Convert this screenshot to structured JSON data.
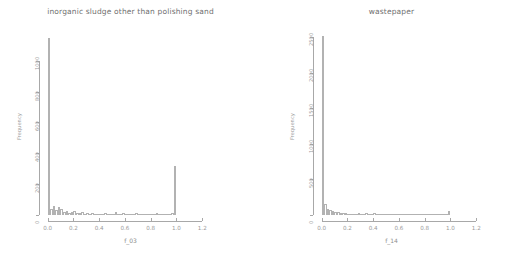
{
  "figure": {
    "background": "#ffffff",
    "line_color": "#a8a8a8",
    "text_color": "#8f8f8f"
  },
  "chart_data": [
    {
      "type": "bar",
      "title": "inorganic sludge other than polishing sand",
      "xlabel": "f_03",
      "ylabel": "Frequency",
      "xlim": [
        -0.02,
        1.26
      ],
      "ylim": [
        0,
        1180
      ],
      "xticks": [
        0.0,
        0.2,
        0.4,
        0.6,
        0.8,
        1.0,
        1.2
      ],
      "xticklabels": [
        "0.0",
        "0.2",
        "0.4",
        "0.6",
        "0.8",
        "1.0",
        "1.2"
      ],
      "yticks": [
        0,
        200,
        400,
        600,
        800,
        1000
      ],
      "yticklabels": [
        "0",
        "200",
        "400",
        "600",
        "800",
        "1000"
      ],
      "grid": false,
      "legend": null,
      "bin_width": 0.02,
      "bin_starts": [
        0.0,
        0.02,
        0.04,
        0.06,
        0.08,
        0.1,
        0.12,
        0.14,
        0.16,
        0.18,
        0.2,
        0.22,
        0.24,
        0.26,
        0.28,
        0.3,
        0.32,
        0.34,
        0.36,
        0.38,
        0.4,
        0.42,
        0.44,
        0.46,
        0.48,
        0.5,
        0.52,
        0.54,
        0.56,
        0.58,
        0.6,
        0.62,
        0.64,
        0.66,
        0.68,
        0.7,
        0.72,
        0.74,
        0.76,
        0.78,
        0.8,
        0.82,
        0.84,
        0.86,
        0.88,
        0.9,
        0.92,
        0.94,
        0.96,
        0.98
      ],
      "values": [
        1150,
        42,
        60,
        34,
        52,
        40,
        22,
        25,
        16,
        20,
        24,
        10,
        12,
        18,
        9,
        11,
        8,
        14,
        7,
        9,
        8,
        6,
        10,
        5,
        7,
        6,
        22,
        5,
        6,
        14,
        5,
        4,
        9,
        5,
        12,
        6,
        4,
        8,
        5,
        7,
        4,
        6,
        10,
        5,
        7,
        6,
        9,
        5,
        14,
        320
      ]
    },
    {
      "type": "bar",
      "title": "wastepaper",
      "xlabel": "f_14",
      "ylabel": "Frequency",
      "xlim": [
        -0.02,
        1.26
      ],
      "ylim": [
        0,
        2560
      ],
      "xticks": [
        0.0,
        0.2,
        0.4,
        0.6,
        0.8,
        1.0,
        1.2
      ],
      "xticklabels": [
        "0.0",
        "0.2",
        "0.4",
        "0.6",
        "0.8",
        "1.0",
        "1.2"
      ],
      "yticks": [
        0,
        500,
        1000,
        1500,
        2000,
        2500
      ],
      "yticklabels": [
        "0",
        "500",
        "1000",
        "1500",
        "2000",
        "2500"
      ],
      "grid": false,
      "legend": null,
      "bin_width": 0.02,
      "bin_starts": [
        0.0,
        0.02,
        0.04,
        0.06,
        0.08,
        0.1,
        0.12,
        0.14,
        0.16,
        0.18,
        0.2,
        0.22,
        0.24,
        0.26,
        0.28,
        0.3,
        0.32,
        0.34,
        0.36,
        0.38,
        0.4,
        0.42,
        0.44,
        0.46,
        0.48,
        0.5,
        0.52,
        0.54,
        0.56,
        0.58,
        0.6,
        0.62,
        0.64,
        0.66,
        0.68,
        0.7,
        0.72,
        0.74,
        0.76,
        0.78,
        0.8,
        0.82,
        0.84,
        0.86,
        0.88,
        0.9,
        0.92,
        0.94,
        0.96,
        0.98
      ],
      "values": [
        2520,
        150,
        90,
        70,
        55,
        45,
        38,
        30,
        26,
        22,
        20,
        16,
        14,
        12,
        28,
        10,
        9,
        26,
        8,
        7,
        24,
        6,
        6,
        5,
        5,
        20,
        4,
        4,
        3,
        3,
        3,
        3,
        2,
        2,
        2,
        2,
        2,
        2,
        2,
        2,
        2,
        2,
        2,
        2,
        2,
        2,
        2,
        2,
        2,
        60
      ]
    }
  ]
}
